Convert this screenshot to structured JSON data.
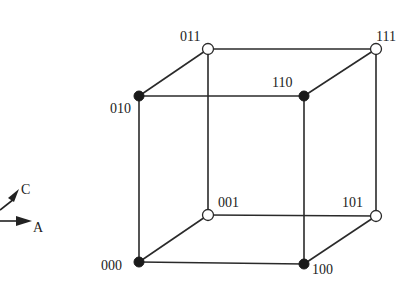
{
  "diagram": {
    "type": "boolean-cube",
    "vertices": [
      {
        "id": "000",
        "label": "000",
        "x": 139,
        "y": 262,
        "filled": true,
        "label_x": 101,
        "label_y": 270
      },
      {
        "id": "100",
        "label": "100",
        "x": 304,
        "y": 264,
        "filled": true,
        "label_x": 312,
        "label_y": 274
      },
      {
        "id": "010",
        "label": "010",
        "x": 139,
        "y": 96,
        "filled": true,
        "label_x": 110,
        "label_y": 113
      },
      {
        "id": "110",
        "label": "110",
        "x": 304,
        "y": 96,
        "filled": true,
        "label_x": 272,
        "label_y": 87
      },
      {
        "id": "001",
        "label": "001",
        "x": 208,
        "y": 215,
        "filled": false,
        "label_x": 218,
        "label_y": 207
      },
      {
        "id": "101",
        "label": "101",
        "x": 376,
        "y": 216,
        "filled": false,
        "label_x": 342,
        "label_y": 207
      },
      {
        "id": "011",
        "label": "011",
        "x": 208,
        "y": 49,
        "filled": false,
        "label_x": 180,
        "label_y": 41
      },
      {
        "id": "111",
        "label": "111",
        "x": 376,
        "y": 49,
        "filled": false,
        "label_x": 376,
        "label_y": 41
      }
    ],
    "edges": [
      [
        "000",
        "100"
      ],
      [
        "000",
        "010"
      ],
      [
        "000",
        "001"
      ],
      [
        "100",
        "110"
      ],
      [
        "100",
        "101"
      ],
      [
        "010",
        "110"
      ],
      [
        "010",
        "011"
      ],
      [
        "001",
        "101"
      ],
      [
        "001",
        "011"
      ],
      [
        "110",
        "111"
      ],
      [
        "101",
        "111"
      ],
      [
        "011",
        "111"
      ]
    ],
    "axes_legend": {
      "items": [
        {
          "name": "A",
          "label": "A",
          "direction": "right"
        },
        {
          "name": "C",
          "label": "C",
          "direction": "up-right (depth)"
        }
      ]
    }
  }
}
